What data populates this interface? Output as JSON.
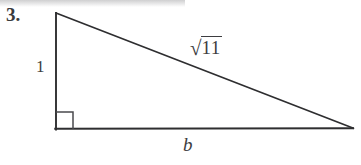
{
  "figure": {
    "problem_number": "3.",
    "labels": {
      "vertical_leg": "1",
      "horizontal_leg": "b",
      "hypotenuse_radical_sign": "√",
      "hypotenuse_radicand": "11",
      "hypotenuse_full": "√11"
    },
    "colors": {
      "background": "#ffffff",
      "stroke": "#2e2e30",
      "text": "#3d3d40",
      "number_text": "#3a3a3c"
    },
    "geometry": {
      "apex": [
        56,
        13
      ],
      "right_angle_vertex": [
        56,
        129
      ],
      "right_vertex": [
        353,
        128
      ],
      "right_angle_marker_size": 17,
      "stroke_width": 1.6
    }
  }
}
